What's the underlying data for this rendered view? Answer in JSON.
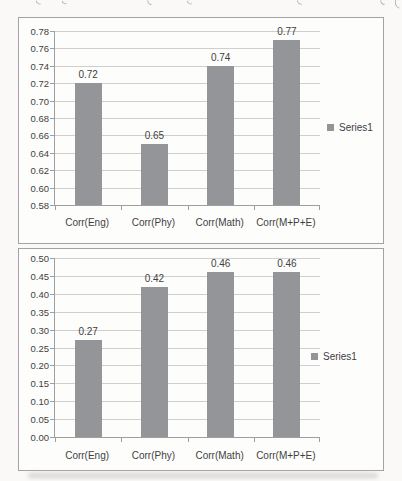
{
  "colors": {
    "page_bg": "#faf9f7",
    "frame_bg": "#fdfdfc",
    "frame_border": "#a3a3a3",
    "bar": "#949598",
    "gridline": "#cfcfcf",
    "axis": "#9f9f9f",
    "text": "#3f3f3f",
    "shadow": "#c6c6c6"
  },
  "chart_data": [
    {
      "type": "bar",
      "title": "",
      "categories": [
        "Corr(Eng)",
        "Corr(Phy)",
        "Corr(Math)",
        "Corr(M+P+E)"
      ],
      "values": [
        0.72,
        0.65,
        0.74,
        0.77
      ],
      "value_labels": [
        "0.72",
        "0.65",
        "0.74",
        "0.77"
      ],
      "series_name": "Series1",
      "legend": "Series1",
      "legend_position": "right",
      "xlabel": "",
      "ylabel": "",
      "ylim": [
        0.58,
        0.78
      ],
      "ytick_step": 0.02,
      "grid": true
    },
    {
      "type": "bar",
      "title": "",
      "categories": [
        "Corr(Eng)",
        "Corr(Phy)",
        "Corr(Math)",
        "Corr(M+P+E)"
      ],
      "values": [
        0.27,
        0.42,
        0.46,
        0.46
      ],
      "value_labels": [
        "0.27",
        "0.42",
        "0.46",
        "0.46"
      ],
      "series_name": "Series1",
      "legend": "Series1",
      "legend_position": "right",
      "xlabel": "",
      "ylabel": "",
      "ylim": [
        0.0,
        0.5
      ],
      "ytick_step": 0.05,
      "grid": true
    }
  ]
}
